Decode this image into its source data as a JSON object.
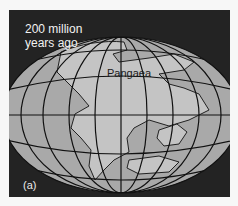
{
  "figure": {
    "title_line1": "200 million",
    "title_line2": "years ago",
    "continent_label": "Pangaea",
    "panel_label": "(a)"
  },
  "colors": {
    "background": "#232323",
    "ocean": "#a9a9a9",
    "land": "#c4c4c4",
    "grid": "#111111",
    "text_light": "#f2f2f2"
  }
}
